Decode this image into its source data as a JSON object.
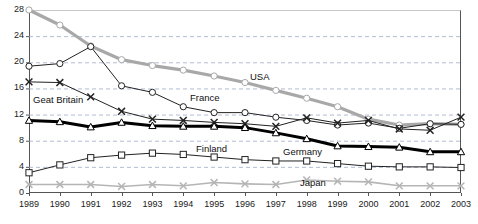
{
  "chart_data": {
    "type": "line",
    "title": "",
    "subtitle": "",
    "xlabel": "",
    "ylabel": "",
    "grid": true,
    "grid_style": "dashed-horizontal",
    "legend": "inline-annotations",
    "legend_position": "on-plot",
    "xlim": [
      1989,
      2003
    ],
    "ylim": [
      0,
      28
    ],
    "yticks": [
      0,
      4,
      8,
      12,
      16,
      20,
      24,
      28
    ],
    "categories": [
      "1989",
      "1990",
      "1991",
      "1992",
      "1993",
      "1994",
      "1995",
      "1996",
      "1997",
      "1998",
      "1999",
      "2000",
      "2001",
      "2002",
      "2003"
    ],
    "x": [
      1989,
      1990,
      1991,
      1992,
      1993,
      1994,
      1995,
      1996,
      1997,
      1998,
      1999,
      2000,
      2001,
      2002,
      2003
    ],
    "series": [
      {
        "name": "USA",
        "label": "USA",
        "color": "#a8a8a8",
        "marker": "circle",
        "line_width": 3.2,
        "values": [
          28.0,
          25.7,
          22.5,
          20.4,
          19.5,
          18.8,
          17.9,
          16.9,
          15.7,
          14.5,
          13.2,
          11.3,
          10.4,
          10.6,
          10.5
        ]
      },
      {
        "name": "France",
        "label": "France",
        "color": "#222222",
        "marker": "circle",
        "line_width": 1.0,
        "values": [
          19.4,
          19.8,
          22.4,
          16.4,
          15.4,
          13.2,
          12.3,
          12.3,
          11.6,
          11.1,
          10.4,
          10.7,
          9.9,
          10.6,
          10.5
        ]
      },
      {
        "name": "Geat Britain",
        "label": "Geat Britain",
        "color": "#222222",
        "marker": "x",
        "line_width": 1.0,
        "values": [
          17.0,
          16.9,
          14.7,
          12.5,
          11.3,
          11.1,
          10.8,
          10.6,
          10.2,
          11.5,
          10.7,
          11.1,
          9.8,
          9.6,
          11.6
        ]
      },
      {
        "name": "Germany",
        "label": "Germany",
        "color": "#000000",
        "marker": "triangle",
        "line_width": 3.0,
        "values": [
          11.1,
          10.9,
          10.1,
          10.8,
          10.3,
          10.2,
          10.2,
          10.0,
          9.2,
          8.3,
          7.2,
          7.1,
          7.0,
          6.3,
          6.3
        ]
      },
      {
        "name": "Finland",
        "label": "Finland",
        "color": "#222222",
        "marker": "square",
        "line_width": 1.0,
        "values": [
          3.1,
          4.3,
          5.4,
          5.8,
          6.1,
          5.9,
          5.5,
          5.1,
          4.9,
          4.9,
          4.5,
          4.1,
          4.0,
          4.0,
          3.9
        ]
      },
      {
        "name": "Japan",
        "label": "Japan",
        "color": "#b5b5b5",
        "marker": "x",
        "line_width": 1.6,
        "values": [
          1.3,
          1.3,
          1.3,
          1.0,
          1.3,
          1.1,
          1.6,
          1.4,
          1.3,
          2.0,
          1.8,
          1.7,
          1.1,
          1.1,
          1.1
        ]
      }
    ],
    "annotations": [
      {
        "text": "USA",
        "x_px": 250,
        "y_px": 72
      },
      {
        "text": "Geat Britain",
        "x_px": 33,
        "y_px": 95
      },
      {
        "text": "France",
        "x_px": 190,
        "y_px": 93
      },
      {
        "text": "Finland",
        "x_px": 196,
        "y_px": 144
      },
      {
        "text": "Germany",
        "x_px": 283,
        "y_px": 147
      },
      {
        "text": "Japan",
        "x_px": 300,
        "y_px": 178
      }
    ]
  },
  "axes": {
    "y_labels": [
      "28",
      "24",
      "20",
      "16",
      "12",
      "8",
      "4",
      "0"
    ],
    "x_labels": [
      "1989",
      "1990",
      "1991",
      "1992",
      "1993",
      "1994",
      "1995",
      "1996",
      "1997",
      "1998",
      "1999",
      "2000",
      "2001",
      "2002",
      "2003"
    ]
  },
  "colors": {
    "usa": "#a8a8a8",
    "japan": "#b5b5b5",
    "germany": "#000000",
    "default_line": "#222222",
    "grid": "#9aa6c4",
    "frame": "#555555",
    "background": "#ffffff"
  }
}
